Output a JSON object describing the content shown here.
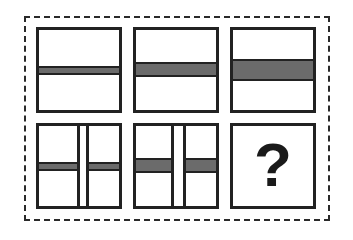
{
  "puzzle": {
    "type": "visual-sequence-matrix",
    "rows": 2,
    "cols": 3,
    "colors": {
      "outline": "#222222",
      "band_fill": "#6b6b6b",
      "background": "#ffffff",
      "frame_dash": "#2a2a2a"
    },
    "panels": [
      {
        "id": 1,
        "row": 1,
        "col": 1,
        "split_vertical": false,
        "band_thickness": "thin"
      },
      {
        "id": 2,
        "row": 1,
        "col": 2,
        "split_vertical": false,
        "band_thickness": "medium"
      },
      {
        "id": 3,
        "row": 1,
        "col": 3,
        "split_vertical": false,
        "band_thickness": "thick"
      },
      {
        "id": 4,
        "row": 2,
        "col": 1,
        "split_vertical": true,
        "band_thickness": "thin"
      },
      {
        "id": 5,
        "row": 2,
        "col": 2,
        "split_vertical": true,
        "band_thickness": "medium"
      },
      {
        "id": 6,
        "row": 2,
        "col": 3,
        "missing": true,
        "label": "?"
      }
    ]
  }
}
